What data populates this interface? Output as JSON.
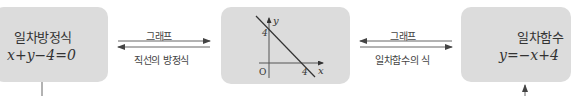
{
  "left_box": {
    "title": "일차방정식",
    "equation": "x+y−4=0"
  },
  "left_arrows": {
    "top_label": "그래프",
    "bottom_label": "직선의 방정식",
    "top_direction": "right",
    "bottom_direction": "left"
  },
  "graph": {
    "y_axis_label": "y",
    "x_axis_label": "x",
    "origin_label": "O",
    "y_intercept_label": "4",
    "x_intercept_label": "4",
    "line": "y=-x+4"
  },
  "right_arrows": {
    "top_label": "그래프",
    "bottom_label": "일차함수의 식",
    "top_direction": "left",
    "bottom_direction": "right"
  },
  "right_box": {
    "title": "일차함수",
    "equation": "y=−x+4"
  },
  "colors": {
    "box_fill": "#dcdcdc",
    "line": "#333333",
    "arrow": "#555555"
  }
}
